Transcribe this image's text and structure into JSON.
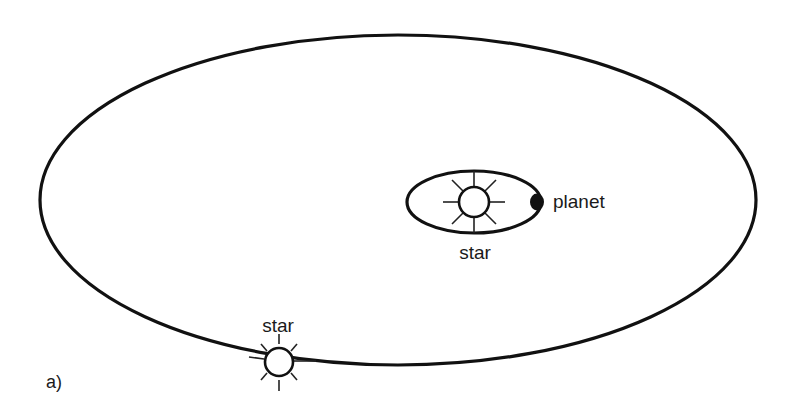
{
  "figure": {
    "panel_label": "a)",
    "background": "#ffffff",
    "stroke_color": "#111111"
  },
  "outer_orbit": {
    "cx": 398,
    "cy": 200,
    "rx": 358,
    "ry": 165,
    "stroke_width": 3.2
  },
  "inner_orbit": {
    "cx": 474,
    "cy": 202,
    "rx": 67,
    "ry": 31,
    "stroke_width": 3.2
  },
  "central_star": {
    "label": "star",
    "cx": 474,
    "cy": 202,
    "r": 15,
    "ray_inner": 15,
    "ray_outer": 31,
    "label_x": 475,
    "label_y": 259
  },
  "planet": {
    "label": "planet",
    "cx": 537,
    "cy": 202,
    "r": 7,
    "label_x": 553,
    "label_y": 208
  },
  "orbiting_star": {
    "label": "star",
    "cx": 279,
    "cy": 362,
    "r": 14,
    "ray_inner": 17,
    "ray_outer": 28,
    "label_x": 278,
    "label_y": 332
  },
  "labels": {
    "central_star": "star",
    "planet": "planet",
    "orbiting_star": "star",
    "panel": "a)"
  }
}
